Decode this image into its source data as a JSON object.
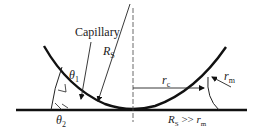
{
  "diagram": {
    "labels": {
      "capillary": "Capillary",
      "rs": "R",
      "rs_sub": "S",
      "theta1": "θ",
      "theta1_sub": "1",
      "theta2": "θ",
      "theta2_sub": "2",
      "rc": "r",
      "rc_sub": "c",
      "rm": "r",
      "rm_sub": "m",
      "condition_r": "R",
      "condition_sub_s": "S",
      "condition_op": " >> ",
      "condition_rm": "r",
      "condition_sub_m": "m"
    },
    "colors": {
      "stroke": "#111111",
      "background": "#ffffff"
    }
  }
}
